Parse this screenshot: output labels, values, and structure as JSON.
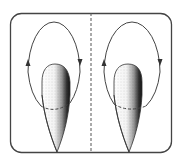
{
  "diagram": {
    "description": "Two side-by-side panels, each showing a closed elliptical flow loop around an elongated tapered (teardrop/bullet) body with dark shading on its right side; arrows indicate circulation up on the left side and down on the right side.",
    "colors": {
      "line": "#444444",
      "body_light": "#ffffff",
      "body_dark": "#111111",
      "background": "#ffffff"
    },
    "panels": [
      {
        "id": "left",
        "loop_direction": "clockwise",
        "arrows": [
          "up-left-side",
          "down-right-side"
        ]
      },
      {
        "id": "right",
        "loop_direction": "clockwise",
        "arrows": [
          "up-left-side",
          "down-right-side"
        ]
      }
    ],
    "divider_style": "dashed"
  }
}
